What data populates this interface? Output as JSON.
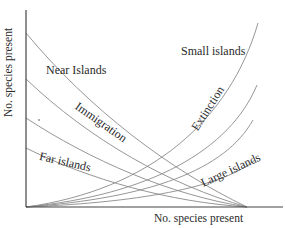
{
  "chart_data": {
    "type": "line",
    "title": "",
    "xlabel": "No. species present",
    "ylabel": "No. species present",
    "grid": false,
    "legend": null,
    "annotations": [
      {
        "text": "Near Islands",
        "x": 38,
        "y": 70
      },
      {
        "text": "Small islands",
        "x": 180,
        "y": 70
      },
      {
        "text": "Immigration",
        "x": 75,
        "y": 86,
        "rotation": 35
      },
      {
        "text": "Extinction",
        "x": 210,
        "y": 113,
        "rotation": -55
      },
      {
        "text": "Far islands",
        "x": 42,
        "y": 162,
        "rotation": 12
      },
      {
        "text": "Large islands",
        "x": 205,
        "y": 178,
        "rotation": -25
      }
    ],
    "series": [
      {
        "name": "Immigration (near islands)",
        "kind": "immigration",
        "points_px": [
          [
            26,
            33
          ],
          [
            247,
            207
          ]
        ],
        "ctrl_px": [
          [
            90,
            110
          ],
          [
            170,
            170
          ]
        ]
      },
      {
        "name": "Immigration 2",
        "kind": "immigration",
        "points_px": [
          [
            26,
            79
          ],
          [
            247,
            207
          ]
        ],
        "ctrl_px": [
          [
            90,
            140
          ],
          [
            170,
            185
          ]
        ]
      },
      {
        "name": "Immigration 3",
        "kind": "immigration",
        "points_px": [
          [
            26,
            118
          ],
          [
            247,
            207
          ]
        ],
        "ctrl_px": [
          [
            90,
            160
          ],
          [
            170,
            195
          ]
        ]
      },
      {
        "name": "Immigration (far islands)",
        "kind": "immigration",
        "points_px": [
          [
            26,
            148
          ],
          [
            247,
            207
          ]
        ],
        "ctrl_px": [
          [
            90,
            180
          ],
          [
            170,
            202
          ]
        ]
      },
      {
        "name": "Extinction (small islands)",
        "kind": "extinction",
        "points_px": [
          [
            26,
            207
          ],
          [
            258,
            23
          ]
        ],
        "ctrl_px": [
          [
            150,
            190
          ],
          [
            230,
            120
          ]
        ]
      },
      {
        "name": "Extinction 2",
        "kind": "extinction",
        "points_px": [
          [
            26,
            207
          ],
          [
            257,
            85
          ]
        ],
        "ctrl_px": [
          [
            150,
            195
          ],
          [
            230,
            150
          ]
        ]
      },
      {
        "name": "Extinction 3",
        "kind": "extinction",
        "points_px": [
          [
            26,
            207
          ],
          [
            253,
            120
          ]
        ],
        "ctrl_px": [
          [
            150,
            198
          ],
          [
            225,
            170
          ]
        ]
      },
      {
        "name": "Extinction (large islands)",
        "kind": "extinction",
        "points_px": [
          [
            26,
            207
          ],
          [
            255,
            160
          ]
        ],
        "ctrl_px": [
          [
            150,
            202
          ],
          [
            225,
            185
          ]
        ]
      }
    ],
    "axes_px": {
      "origin": [
        26,
        207
      ],
      "x_end": 283,
      "y_top": 10
    }
  },
  "labels": {
    "near": "Near Islands",
    "small": "Small islands",
    "immigration": "Immigration",
    "extinction": "Extinction",
    "far": "Far islands",
    "large": "Large islands",
    "xlabel": "No. species present",
    "ylabel": "No. species present"
  },
  "colors": {
    "curve": "#8a8a8a",
    "axis": "#444444",
    "text": "#2a2a2a"
  }
}
